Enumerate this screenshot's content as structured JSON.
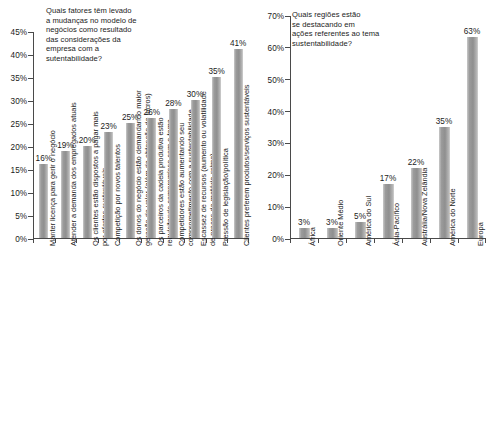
{
  "chart_data": [
    {
      "id": "left",
      "type": "bar",
      "title": "Quais fatores têm levado\na mudanças no modelo de\nnegócios como resultado\ndas considerações da\nempresa com a\nsutentabilidade?",
      "xlabel": "",
      "ylabel": "",
      "ylim": [
        0,
        45
      ],
      "ytick_labels": [
        "0%",
        "5%",
        "10%",
        "15%",
        "20%",
        "25%",
        "30%",
        "35%",
        "40%",
        "45%"
      ],
      "ytick_values": [
        0,
        5,
        10,
        15,
        20,
        25,
        30,
        35,
        40,
        45
      ],
      "grid": false,
      "legend": "none",
      "categories": [
        "Manter licença para gerir o negócio",
        "Atender a demanda dos empregados atuais",
        "Os clientes estão dispostos a pagar mais\npor ofertas sustentáveis",
        "Competição por novos talentos",
        "Os donos do negócio estão demandando maior\ngeração de valor (além da obtenção de lucros)",
        "Os parceiros da cadeia produtiva estão\nrequisitando compromisso com o tema",
        "Competidores estão aumentando seu\ncomprometimento com a sustentabilidade",
        "Escassez de recursos (aumento ou volatilidade\nde preços de matéria-prima)",
        "Pressão de legislação/política",
        "Clientes preferem produtos/serviços sustentáveis"
      ],
      "values": [
        16,
        19,
        20,
        23,
        25,
        26,
        28,
        30,
        35,
        41
      ],
      "value_labels": [
        "16%",
        "19%",
        "20%",
        "23%",
        "25%",
        "26%",
        "28%",
        "30%",
        "35%",
        "41%"
      ]
    },
    {
      "id": "right",
      "type": "bar",
      "title": "Quais regiões estão\nse destacando em\nações referentes ao tema\nsustentabilidade?",
      "xlabel": "",
      "ylabel": "",
      "ylim": [
        0,
        70
      ],
      "ytick_labels": [
        "0%",
        "10%",
        "20%",
        "30%",
        "40%",
        "50%",
        "60%",
        "70%"
      ],
      "ytick_values": [
        0,
        10,
        20,
        30,
        40,
        50,
        60,
        70
      ],
      "grid": false,
      "legend": "none",
      "categories": [
        "África",
        "Oriente Médio",
        "América do Sul",
        "Ásia-Pacífico",
        "Austrália/Nova Zelândia",
        "América do Norte",
        "Europa"
      ],
      "values": [
        3,
        3,
        5,
        17,
        22,
        35,
        63
      ],
      "value_labels": [
        "3%",
        "3%",
        "5%",
        "17%",
        "22%",
        "35%",
        "63%"
      ]
    }
  ],
  "colors": {
    "bar_light": "#c9c9c9",
    "bar_mid": "#8f8f8f",
    "axis": "#4a4a4a",
    "text": "#1b1b1b",
    "background": "#ffffff"
  }
}
